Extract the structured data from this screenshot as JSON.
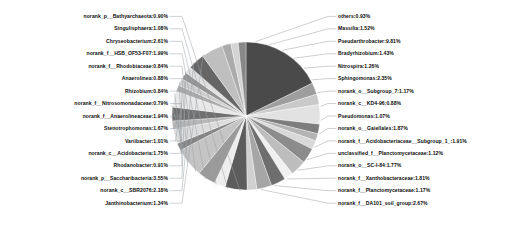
{
  "chart_data": {
    "type": "pie",
    "title": "",
    "units": "percent",
    "legend_position": "none",
    "labels_show_percent": true,
    "start_angle_deg": -90,
    "direction": "clockwise",
    "categories": [
      "Pseudarthrobacter",
      "Bradyrhizobium",
      "Nitrospira",
      "Sphingomonas",
      "norank_o__Subgroup_7",
      "norank_c__KD4-96",
      "Pseudomonas",
      "norank_o__Gaiellales",
      "norank_f__Acidobacteriaceae__Subgroup_1_",
      "unclassified_f__Planctomycetaceae",
      "norank_o__SC-I-84",
      "norank_f__Xanthobacteraceae",
      "norank_f__Planctomycetaceae",
      "norank_f__DA101_soil_group",
      "Janthinobacterium",
      "norank_c__SBR2076",
      "norank_p__Saccharibacteria",
      "Rhodanobacter",
      "norank_c__Acidobacteria",
      "Variibacter",
      "Stenotrophomonas",
      "norank_f__Anaerolineaceae",
      "norank_f__Nitrosomonadaceae",
      "Rhizobium",
      "Anaerolinea",
      "norank_f__Rhodobiaceae",
      "norank_f__HSB_OF53-F07",
      "Chryseobacterium",
      "Singulisphaera",
      "norank_p__Bathyarchaeota",
      "others"
    ],
    "values": [
      9.81,
      1.43,
      1.26,
      2.35,
      1.17,
      0.88,
      1.07,
      1.87,
      1.91,
      1.12,
      1.77,
      1.81,
      1.17,
      2.67,
      1.34,
      2.18,
      3.55,
      0.91,
      1.75,
      1.01,
      1.67,
      1.94,
      0.79,
      0.84,
      0.88,
      0.84,
      1.99,
      2.61,
      1.08,
      0.9,
      0.93
    ]
  },
  "labels_left": [
    {
      "name": "norank_p__Bathyarchaeota",
      "value": "0.90%",
      "text": "norank_p__Bathyarchaeota:0.90%"
    },
    {
      "name": "Singulisphaera",
      "value": "1.08%",
      "text": "Singulisphaera:1.08%"
    },
    {
      "name": "Chryseobacterium",
      "value": "2.61%",
      "text": "Chryseobacterium:2.61%"
    },
    {
      "name": "norank_f__HSB_OF53-F07",
      "value": "1.99%",
      "text": "norank_f__HSB_OF53-F07:1.99%"
    },
    {
      "name": "norank_f__Rhodobiaceae",
      "value": "0.84%",
      "text": "norank_f__Rhodobiaceae:0.84%"
    },
    {
      "name": "Anaerolinea",
      "value": "0.88%",
      "text": "Anaerolinea:0.88%"
    },
    {
      "name": "Rhizobium",
      "value": "0.84%",
      "text": "Rhizobium:0.84%"
    },
    {
      "name": "norank_f__Nitrosomonadaceae",
      "value": "0.79%",
      "text": "norank_f__Nitrosomonadaceae:0.79%"
    },
    {
      "name": "norank_f__Anaerolineaceae",
      "value": "1.94%",
      "text": "norank_f__Anaerolineaceae:1.94%"
    },
    {
      "name": "Stenotrophomonas",
      "value": "1.67%",
      "text": "Stenotrophomonas:1.67%"
    },
    {
      "name": "Variibacter",
      "value": "1.01%",
      "text": "Variibacter:1.01%"
    },
    {
      "name": "norank_c__Acidobacteria",
      "value": "1.75%",
      "text": "norank_c__Acidobacteria:1.75%"
    },
    {
      "name": "Rhodanobacter",
      "value": "0.91%",
      "text": "Rhodanobacter:0.91%"
    },
    {
      "name": "norank_p__Saccharibacteria",
      "value": "3.55%",
      "text": "norank_p__Saccharibacteria:3.55%"
    },
    {
      "name": "norank_c__SBR2076",
      "value": "2.18%",
      "text": "norank_c__SBR2076:2.18%"
    },
    {
      "name": "Janthinobacterium",
      "value": "1.34%",
      "text": "Janthinobacterium:1.34%"
    }
  ],
  "labels_right": [
    {
      "name": "others",
      "value": "0.93%",
      "text": "others:0.93%"
    },
    {
      "name": "Massilia",
      "value": "1.52%",
      "text": "Massilia:1.52%"
    },
    {
      "name": "Pseudarthrobacter",
      "value": "9.81%",
      "text": "Pseudarthrobacter:9.81%"
    },
    {
      "name": "Bradyrhizobium",
      "value": "1.43%",
      "text": "Bradyrhizobium:1.43%"
    },
    {
      "name": "Nitrospira",
      "value": "1.26%",
      "text": "Nitrospira:1.26%"
    },
    {
      "name": "Sphingomonas",
      "value": "2.35%",
      "text": "Sphingomonas:2.35%"
    },
    {
      "name": "norank_o__Subgroup_7",
      "value": "1.17%",
      "text": "norank_o__Subgroup_7:1.17%"
    },
    {
      "name": "norank_c__KD4-96",
      "value": "0.88%",
      "text": "norank_c__KD4-96:0.88%"
    },
    {
      "name": "Pseudomonas",
      "value": "1.07%",
      "text": "Pseudomonas:1.07%"
    },
    {
      "name": "norank_o__Gaiellales",
      "value": "1.87%",
      "text": "norank_o__Gaiellales:1.87%"
    },
    {
      "name": "norank_f__Acidobacteriaceae__Subgroup_1_",
      "value": "1.91%",
      "text": "norank_f__Acidobacteriaceae__Subgroup_1_:1.91%"
    },
    {
      "name": "unclassified_f__Planctomycetaceae",
      "value": "1.12%",
      "text": "unclassified_f__Planctomycetaceae:1.12%"
    },
    {
      "name": "norank_o__SC-I-84",
      "value": "1.77%",
      "text": "norank_o__SC-I-84:1.77%"
    },
    {
      "name": "norank_f__Xanthobacteraceae",
      "value": "1.81%",
      "text": "norank_f__Xanthobacteraceae:1.81%"
    },
    {
      "name": "norank_f__Planctomycetaceae",
      "value": "1.17%",
      "text": "norank_f__Planctomycetaceae:1.17%"
    },
    {
      "name": "norank_f__DA101_soil_group",
      "value": "2.67%",
      "text": "norank_f__DA101_soil_group:2.67%"
    }
  ],
  "palette": {
    "highlight_slice": "#4a4a4a",
    "background": "#ffffff",
    "leader_line": "#9aa0a6",
    "text": "#0b0b0b",
    "slice_greys": [
      "#4a4a4a",
      "#9e9e9e",
      "#c9c9c9",
      "#e2e2e2",
      "#7d7d7d",
      "#b3b3b3",
      "#d8d8d8",
      "#8c8c8c",
      "#bdbdbd",
      "#f0f0f0",
      "#6e6e6e",
      "#a6a6a6",
      "#d0d0d0",
      "#5c5c5c",
      "#ededed",
      "#9a9a9a",
      "#c4c4c4",
      "#848484",
      "#dcdcdc",
      "#b8b8b8",
      "#707070",
      "#e8e8e8",
      "#aaaaaa",
      "#cecece",
      "#949494",
      "#dfdfdf",
      "#666666",
      "#bfbfbf",
      "#ababab",
      "#d4d4d4",
      "#888888"
    ]
  },
  "geometry": {
    "cx": 246,
    "cy": 116,
    "r": 74
  }
}
